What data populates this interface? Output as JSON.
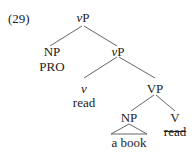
{
  "example_number": "(29)",
  "tree": {
    "root": {
      "cat_prefix": "v",
      "cat_suffix": "P"
    },
    "spec": {
      "cat": "NP",
      "content": "PRO"
    },
    "vbar": {
      "cat_prefix": "v",
      "cat_suffix": "P"
    },
    "v_head": {
      "cat": "v",
      "content": "read"
    },
    "vp": {
      "cat": "VP"
    },
    "object": {
      "cat": "NP",
      "content": "a book"
    },
    "V_head": {
      "cat": "V",
      "content": "read",
      "struck": true
    }
  }
}
